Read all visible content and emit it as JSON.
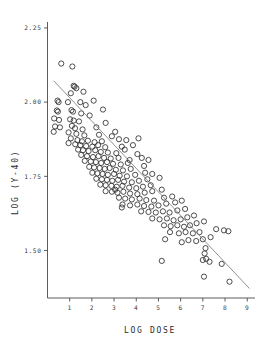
{
  "chart_data": {
    "type": "scatter",
    "title": "",
    "xlabel": "LOG DOSE",
    "ylabel": "LOG (Y-40)",
    "xlim": [
      0,
      9.35
    ],
    "ylim": [
      1.34,
      2.27
    ],
    "grid": false,
    "legend": null,
    "marker_style": "open-circle",
    "x_ticks": [
      1,
      2,
      3,
      4,
      5,
      6,
      7,
      8,
      9
    ],
    "x_tick_labels": [
      "1",
      "2",
      "3",
      "4",
      "5",
      "6",
      "7",
      "8",
      "9"
    ],
    "y_ticks": [
      2.25,
      2.0,
      1.75,
      1.5
    ],
    "y_tick_labels": [
      "2.25",
      "2.00",
      "1.75",
      "1.50"
    ],
    "fit_line": {
      "name": "regression line",
      "x": [
        0.28,
        9.1
      ],
      "y": [
        2.072,
        1.372
      ]
    },
    "points": [
      [
        0.62,
        2.13
      ],
      [
        1.12,
        2.12
      ],
      [
        1.18,
        2.055
      ],
      [
        1.22,
        2.052
      ],
      [
        1.3,
        2.047
      ],
      [
        1.62,
        2.035
      ],
      [
        1.05,
        2.03
      ],
      [
        0.45,
        2.005
      ],
      [
        0.5,
        2.0
      ],
      [
        0.92,
        2.0
      ],
      [
        1.48,
        2.0
      ],
      [
        2.08,
        2.005
      ],
      [
        1.72,
        1.99
      ],
      [
        0.42,
        1.972
      ],
      [
        0.47,
        1.968
      ],
      [
        1.08,
        1.973
      ],
      [
        1.15,
        1.968
      ],
      [
        1.52,
        1.962
      ],
      [
        2.5,
        1.975
      ],
      [
        1.9,
        1.955
      ],
      [
        0.3,
        1.945
      ],
      [
        0.52,
        1.94
      ],
      [
        1.02,
        1.942
      ],
      [
        1.18,
        1.938
      ],
      [
        1.42,
        1.935
      ],
      [
        2.62,
        1.93
      ],
      [
        0.34,
        1.918
      ],
      [
        0.56,
        1.915
      ],
      [
        1.1,
        1.92
      ],
      [
        1.24,
        1.912
      ],
      [
        1.58,
        1.908
      ],
      [
        2.2,
        1.915
      ],
      [
        3.05,
        1.9
      ],
      [
        0.28,
        1.9
      ],
      [
        0.95,
        1.898
      ],
      [
        1.3,
        1.893
      ],
      [
        1.66,
        1.888
      ],
      [
        2.32,
        1.89
      ],
      [
        2.9,
        1.885
      ],
      [
        1.05,
        1.878
      ],
      [
        1.35,
        1.872
      ],
      [
        1.55,
        1.868
      ],
      [
        1.82,
        1.87
      ],
      [
        2.12,
        1.865
      ],
      [
        2.45,
        1.868
      ],
      [
        3.22,
        1.875
      ],
      [
        3.55,
        1.872
      ],
      [
        4.1,
        1.878
      ],
      [
        0.95,
        1.862
      ],
      [
        1.25,
        1.858
      ],
      [
        1.48,
        1.855
      ],
      [
        1.74,
        1.852
      ],
      [
        2.02,
        1.85
      ],
      [
        2.28,
        1.855
      ],
      [
        2.6,
        1.848
      ],
      [
        3.35,
        1.85
      ],
      [
        3.85,
        1.855
      ],
      [
        1.38,
        1.84
      ],
      [
        1.6,
        1.838
      ],
      [
        1.85,
        1.835
      ],
      [
        2.15,
        1.838
      ],
      [
        2.4,
        1.832
      ],
      [
        2.72,
        1.83
      ],
      [
        3.1,
        1.828
      ],
      [
        3.48,
        1.84
      ],
      [
        4.05,
        1.825
      ],
      [
        1.52,
        1.822
      ],
      [
        1.78,
        1.818
      ],
      [
        2.05,
        1.815
      ],
      [
        2.3,
        1.818
      ],
      [
        2.55,
        1.812
      ],
      [
        2.85,
        1.81
      ],
      [
        3.2,
        1.812
      ],
      [
        3.7,
        1.805
      ],
      [
        1.68,
        1.802
      ],
      [
        1.95,
        1.8
      ],
      [
        2.18,
        1.798
      ],
      [
        2.42,
        1.795
      ],
      [
        2.68,
        1.798
      ],
      [
        2.95,
        1.792
      ],
      [
        3.3,
        1.79
      ],
      [
        3.62,
        1.795
      ],
      [
        4.25,
        1.812
      ],
      [
        4.55,
        1.805
      ],
      [
        1.88,
        1.782
      ],
      [
        2.1,
        1.78
      ],
      [
        2.35,
        1.778
      ],
      [
        2.58,
        1.775
      ],
      [
        2.8,
        1.778
      ],
      [
        3.08,
        1.772
      ],
      [
        3.4,
        1.77
      ],
      [
        3.75,
        1.775
      ],
      [
        4.35,
        1.785
      ],
      [
        2.02,
        1.762
      ],
      [
        2.25,
        1.76
      ],
      [
        2.48,
        1.758
      ],
      [
        2.72,
        1.755
      ],
      [
        3.0,
        1.758
      ],
      [
        3.25,
        1.752
      ],
      [
        3.58,
        1.75
      ],
      [
        3.95,
        1.755
      ],
      [
        4.4,
        1.762
      ],
      [
        4.72,
        1.758
      ],
      [
        2.2,
        1.742
      ],
      [
        2.45,
        1.74
      ],
      [
        2.68,
        1.738
      ],
      [
        2.92,
        1.735
      ],
      [
        3.18,
        1.738
      ],
      [
        3.45,
        1.732
      ],
      [
        3.8,
        1.73
      ],
      [
        4.12,
        1.735
      ],
      [
        4.5,
        1.74
      ],
      [
        5.05,
        1.745
      ],
      [
        2.38,
        1.722
      ],
      [
        2.62,
        1.72
      ],
      [
        2.88,
        1.718
      ],
      [
        3.12,
        1.715
      ],
      [
        3.38,
        1.718
      ],
      [
        3.68,
        1.712
      ],
      [
        4.0,
        1.71
      ],
      [
        4.3,
        1.715
      ],
      [
        4.65,
        1.72
      ],
      [
        3.05,
        1.705
      ],
      [
        2.62,
        1.7
      ],
      [
        2.9,
        1.698
      ],
      [
        3.15,
        1.695
      ],
      [
        3.42,
        1.698
      ],
      [
        3.72,
        1.692
      ],
      [
        4.05,
        1.69
      ],
      [
        4.38,
        1.695
      ],
      [
        4.72,
        1.7
      ],
      [
        5.15,
        1.705
      ],
      [
        3.22,
        1.678
      ],
      [
        3.5,
        1.675
      ],
      [
        3.8,
        1.672
      ],
      [
        4.15,
        1.675
      ],
      [
        4.45,
        1.67
      ],
      [
        4.8,
        1.668
      ],
      [
        5.25,
        1.678
      ],
      [
        5.62,
        1.682
      ],
      [
        3.38,
        1.655
      ],
      [
        3.72,
        1.652
      ],
      [
        4.05,
        1.655
      ],
      [
        4.35,
        1.65
      ],
      [
        4.68,
        1.648
      ],
      [
        5.0,
        1.652
      ],
      [
        5.35,
        1.658
      ],
      [
        5.75,
        1.662
      ],
      [
        6.05,
        1.668
      ],
      [
        4.22,
        1.632
      ],
      [
        4.55,
        1.63
      ],
      [
        4.88,
        1.628
      ],
      [
        5.2,
        1.632
      ],
      [
        5.5,
        1.628
      ],
      [
        5.85,
        1.635
      ],
      [
        6.2,
        1.64
      ],
      [
        3.35,
        1.645
      ],
      [
        4.72,
        1.608
      ],
      [
        5.05,
        1.605
      ],
      [
        5.38,
        1.608
      ],
      [
        5.68,
        1.602
      ],
      [
        6.0,
        1.605
      ],
      [
        6.3,
        1.612
      ],
      [
        6.6,
        1.618
      ],
      [
        5.25,
        1.585
      ],
      [
        5.55,
        1.582
      ],
      [
        5.85,
        1.585
      ],
      [
        6.15,
        1.58
      ],
      [
        6.42,
        1.585
      ],
      [
        6.72,
        1.592
      ],
      [
        7.05,
        1.598
      ],
      [
        5.52,
        1.562
      ],
      [
        5.92,
        1.558
      ],
      [
        6.22,
        1.562
      ],
      [
        6.55,
        1.558
      ],
      [
        6.85,
        1.562
      ],
      [
        7.6,
        1.572
      ],
      [
        7.95,
        1.568
      ],
      [
        8.15,
        1.565
      ],
      [
        5.3,
        1.538
      ],
      [
        6.35,
        1.535
      ],
      [
        6.7,
        1.532
      ],
      [
        7.0,
        1.538
      ],
      [
        7.35,
        1.545
      ],
      [
        6.05,
        1.528
      ],
      [
        5.15,
        1.465
      ],
      [
        7.0,
        1.468
      ],
      [
        7.15,
        1.472
      ],
      [
        7.08,
        1.49
      ],
      [
        7.12,
        1.508
      ],
      [
        7.3,
        1.462
      ],
      [
        7.85,
        1.455
      ],
      [
        7.05,
        1.412
      ],
      [
        8.2,
        1.395
      ]
    ]
  },
  "axis": {
    "y_title": "LOG (Y-40)",
    "x_title": "LOG DOSE"
  }
}
